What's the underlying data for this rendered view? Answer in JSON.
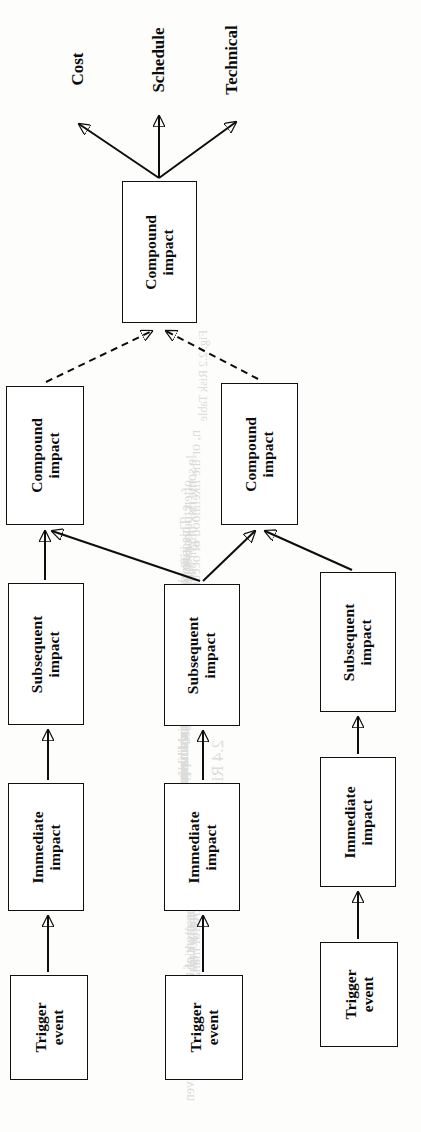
{
  "figure": {
    "type": "diagram",
    "subtype": "risk-impact-cascade-tree",
    "orientation": "rotated-90-ccw",
    "page_background": "#fdfdfc",
    "ink_color": "#0d0d0d"
  },
  "outcome_labels": [
    {
      "id": "cost",
      "text": "Cost"
    },
    {
      "id": "schedule",
      "text": "Schedule"
    },
    {
      "id": "technical",
      "text": "Technical"
    }
  ],
  "nodes": [
    {
      "id": "compound-top",
      "line1": "Compound",
      "line2": "impact",
      "x": 122,
      "y": 181,
      "w": 75,
      "h": 142
    },
    {
      "id": "compound-left",
      "line1": "Compound",
      "line2": "impact",
      "x": 6,
      "y": 386,
      "w": 78,
      "h": 139
    },
    {
      "id": "compound-right",
      "line1": "Compound",
      "line2": "impact",
      "x": 221,
      "y": 383,
      "w": 77,
      "h": 142
    },
    {
      "id": "subsequent-1",
      "line1": "Subsequent",
      "line2": "impact",
      "x": 8,
      "y": 583,
      "w": 76,
      "h": 142
    },
    {
      "id": "subsequent-2",
      "line1": "Subsequent",
      "line2": "impact",
      "x": 164,
      "y": 584,
      "w": 76,
      "h": 142
    },
    {
      "id": "subsequent-3",
      "line1": "Subsequent",
      "line2": "impact",
      "x": 320,
      "y": 572,
      "w": 76,
      "h": 140
    },
    {
      "id": "immediate-1",
      "line1": "Immediate",
      "line2": "impact",
      "x": 8,
      "y": 783,
      "w": 76,
      "h": 128
    },
    {
      "id": "immediate-2",
      "line1": "Immediate",
      "line2": "impact",
      "x": 164,
      "y": 783,
      "w": 76,
      "h": 128
    },
    {
      "id": "immediate-3",
      "line1": "Immediate",
      "line2": "impact",
      "x": 320,
      "y": 757,
      "w": 76,
      "h": 130
    },
    {
      "id": "trigger-1",
      "line1": "Trigger",
      "line2": "event",
      "x": 10,
      "y": 975,
      "w": 78,
      "h": 105
    },
    {
      "id": "trigger-2",
      "line1": "Trigger",
      "line2": "event",
      "x": 165,
      "y": 975,
      "w": 78,
      "h": 105
    },
    {
      "id": "trigger-3",
      "line1": "Trigger",
      "line2": "event",
      "x": 320,
      "y": 942,
      "w": 78,
      "h": 105
    }
  ],
  "edges": [
    {
      "id": "trigger1-to-immediate1",
      "from": "trigger-1",
      "to": "immediate-1",
      "style": "solid"
    },
    {
      "id": "trigger2-to-immediate2",
      "from": "trigger-2",
      "to": "immediate-2",
      "style": "solid"
    },
    {
      "id": "trigger3-to-immediate3",
      "from": "trigger-3",
      "to": "immediate-3",
      "style": "solid"
    },
    {
      "id": "immediate1-to-subsequent1",
      "from": "immediate-1",
      "to": "subsequent-1",
      "style": "solid"
    },
    {
      "id": "immediate2-to-subsequent2",
      "from": "immediate-2",
      "to": "subsequent-2",
      "style": "solid"
    },
    {
      "id": "immediate3-to-subsequent3",
      "from": "immediate-3",
      "to": "subsequent-3",
      "style": "solid"
    },
    {
      "id": "subsequent1-to-compoundleft",
      "from": "subsequent-1",
      "to": "compound-left",
      "style": "solid"
    },
    {
      "id": "subsequent2-to-compoundleft",
      "from": "subsequent-2",
      "to": "compound-left",
      "style": "solid"
    },
    {
      "id": "subsequent2-to-compoundright",
      "from": "subsequent-2",
      "to": "compound-right",
      "style": "solid"
    },
    {
      "id": "subsequent3-to-compoundright",
      "from": "subsequent-3",
      "to": "compound-right",
      "style": "solid"
    },
    {
      "id": "compoundleft-to-compoundtop",
      "from": "compound-left",
      "to": "compound-top",
      "style": "dashed"
    },
    {
      "id": "compoundright-to-compoundtop",
      "from": "compound-right",
      "to": "compound-top",
      "style": "dashed"
    },
    {
      "id": "compoundtop-to-cost",
      "from": "compound-top",
      "to": "cost",
      "style": "solid"
    },
    {
      "id": "compoundtop-to-schedule",
      "from": "compound-top",
      "to": "schedule",
      "style": "solid"
    },
    {
      "id": "compoundtop-to-technical",
      "from": "compound-top",
      "to": "technical",
      "style": "solid"
    }
  ],
  "bleed_through": [
    {
      "t": "Fig. 2.2   Risk   Table",
      "x": 196,
      "y": 330,
      "s": 12
    },
    {
      "t": "n, or the likelihood of occurrence, the",
      "x": 188,
      "y": 430,
      "s": 14
    },
    {
      "t": "le some risk might cause",
      "x": 184,
      "y": 455,
      "s": 14
    },
    {
      "t": "often the consequence. Generally, one",
      "x": 180,
      "y": 480,
      "s": 14
    },
    {
      "t": "e. This is impact of the risk, if realized,",
      "x": 178,
      "y": 505,
      "s": 14
    },
    {
      "t": "pacting a project. It should be stressed",
      "x": 178,
      "y": 530,
      "s": 14
    },
    {
      "t": "an identifies perverse, resulting multiple",
      "x": 176,
      "y": 555,
      "s": 14
    },
    {
      "t": "compound level to the that risk impacts",
      "x": 176,
      "y": 580,
      "s": 14
    },
    {
      "t": "is a known risk that is not having a core",
      "x": 176,
      "y": 605,
      "s": 14
    },
    {
      "t": "has a second and internal to the project",
      "x": 176,
      "y": 630,
      "s": 14
    },
    {
      "t": "very aspect and linkage of the key issue",
      "x": 176,
      "y": 655,
      "s": 14
    },
    {
      "t": "2.4   Risk Impact",
      "x": 208,
      "y": 740,
      "s": 17
    },
    {
      "t": "in from the perspective of management",
      "x": 188,
      "y": 800,
      "s": 14
    },
    {
      "t": "d. At times, the impact may involve",
      "x": 185,
      "y": 825,
      "s": 14
    },
    {
      "t": "an exceptionally high or worst case, the",
      "x": 183,
      "y": 850,
      "s": 14
    },
    {
      "t": "e. Assessment of the risk source is given",
      "x": 182,
      "y": 875,
      "s": 14
    }
  ]
}
